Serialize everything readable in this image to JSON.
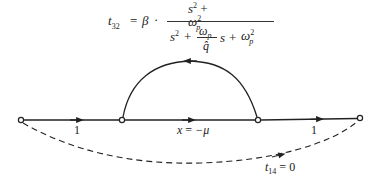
{
  "formula": {
    "lhs": "t",
    "lhs_sub": "32",
    "equals": "=",
    "beta": "β",
    "dot": "·",
    "numerator": {
      "s": "s",
      "s_exp": "2",
      "plus": "+",
      "omega": "ω",
      "omega_sub": "p",
      "omega_exp": "2"
    },
    "denominator": {
      "s": "s",
      "s_exp": "2",
      "plus1": "+",
      "frac_num": "ω",
      "frac_num_sub": "p",
      "frac_den": "q̂",
      "s2": "s",
      "plus2": "+",
      "omega": "ω",
      "omega_sub": "p",
      "omega_exp": "2"
    }
  },
  "graph": {
    "nodes": [
      {
        "id": "node-1",
        "x": 21,
        "y": 120
      },
      {
        "id": "node-2",
        "x": 122,
        "y": 120
      },
      {
        "id": "node-3",
        "x": 258,
        "y": 120
      },
      {
        "id": "node-4",
        "x": 360,
        "y": 118
      }
    ],
    "branches": [
      {
        "id": "branch-1-2",
        "label": "1",
        "style": "solid"
      },
      {
        "id": "branch-2-3",
        "label_var": "x",
        "label_eq": "=",
        "label_val": "−μ",
        "style": "solid"
      },
      {
        "id": "branch-3-4",
        "label": "1",
        "style": "solid"
      },
      {
        "id": "feedback-3-2",
        "style": "solid-arc",
        "direction": "right-to-left"
      },
      {
        "id": "feedforward-1-4",
        "label_var": "t",
        "label_sub": "14",
        "label_eq": "=",
        "label_val": "0",
        "style": "dashed"
      }
    ]
  },
  "colors": {
    "line": "#222222",
    "background": "#ffffff"
  }
}
